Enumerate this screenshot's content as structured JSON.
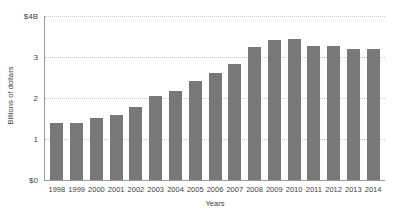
{
  "chart_data": {
    "type": "bar",
    "title": "",
    "subtitle": "",
    "xlabel": "Years",
    "ylabel": "Billions of dollars",
    "categories": [
      "1998",
      "1999",
      "2000",
      "2001",
      "2002",
      "2003",
      "2004",
      "2005",
      "2006",
      "2007",
      "2008",
      "2009",
      "2010",
      "2011",
      "2012",
      "2013",
      "2014"
    ],
    "values": [
      1.4,
      1.4,
      1.52,
      1.58,
      1.78,
      2.05,
      2.18,
      2.42,
      2.6,
      2.83,
      3.25,
      3.42,
      3.43,
      3.28,
      3.26,
      3.2,
      3.2
    ],
    "series": [
      {
        "name": "Billions of dollars",
        "values": [
          1.4,
          1.4,
          1.52,
          1.58,
          1.78,
          2.05,
          2.18,
          2.42,
          2.6,
          2.83,
          3.25,
          3.42,
          3.43,
          3.28,
          3.26,
          3.2,
          3.2
        ]
      }
    ],
    "ylim": [
      0,
      4
    ],
    "y_ticks": [
      0,
      1,
      2,
      3,
      4
    ],
    "y_tick_labels": [
      "$0",
      "1",
      "2",
      "3",
      "$4B"
    ],
    "grid": true,
    "grid_axis": "y",
    "legend": false,
    "bar_color": "#787878",
    "gridline_color": "#c9c9c9",
    "axis_color": "#9a9a9a",
    "text_color": "#3d3d3d",
    "background_color": "#ffffff"
  },
  "axes": {
    "y_title": "Billions of dollars",
    "x_title": "Years"
  }
}
